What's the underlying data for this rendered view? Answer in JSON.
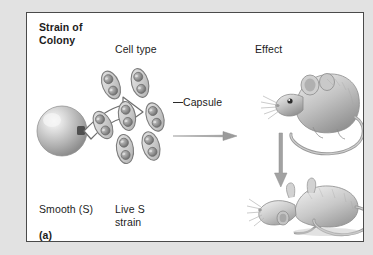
{
  "figure": {
    "part_label": "(a)",
    "panel_bg": "#ffffff",
    "border_color": "#4a4a4a",
    "outer_bg": "#e2e2e2"
  },
  "headers": {
    "strain_of_colony": "Strain of\nColony",
    "cell_type": "Cell type",
    "effect": "Effect"
  },
  "labels": {
    "capsule": "Capsule",
    "smooth_s": "Smooth (S)",
    "live_s_strain": "Live S\nstrain"
  },
  "diagram": {
    "colony": {
      "name": "smooth-colony-sphere",
      "shape": "sphere",
      "fill": "#b9b9b9",
      "highlight": "#f0f0f0"
    },
    "bacteria": {
      "name": "encapsulated-diplococci",
      "count": 7,
      "cells_per_capsule": 2,
      "capsule_fill": "#cfcfcf",
      "cell_fill": "#8f8f8f"
    },
    "arrows": [
      {
        "name": "curved-arrow-colony-to-cells",
        "style": "outlined-curved",
        "direction": "right-up"
      },
      {
        "name": "horizontal-arrow-cells-to-mouse",
        "style": "solid-thin",
        "direction": "right"
      },
      {
        "name": "vertical-arrow-live-to-dead-mouse",
        "style": "solid-thin",
        "direction": "down"
      }
    ],
    "mice": [
      {
        "name": "live-mouse",
        "state": "alive",
        "pose": "standing",
        "facing": "left"
      },
      {
        "name": "dead-mouse",
        "state": "dead",
        "pose": "lying-on-side",
        "facing": "left"
      }
    ]
  }
}
